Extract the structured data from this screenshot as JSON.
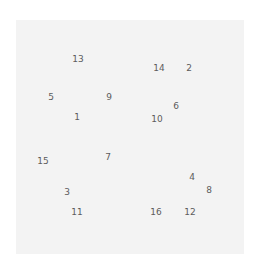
{
  "panel": {
    "background": "#f3f3f3"
  },
  "numbers": [
    {
      "label": "13",
      "x": 78,
      "y": 59
    },
    {
      "label": "14",
      "x": 159,
      "y": 68
    },
    {
      "label": "2",
      "x": 189,
      "y": 68
    },
    {
      "label": "5",
      "x": 51,
      "y": 97
    },
    {
      "label": "9",
      "x": 109,
      "y": 97
    },
    {
      "label": "6",
      "x": 176,
      "y": 106
    },
    {
      "label": "1",
      "x": 77,
      "y": 117
    },
    {
      "label": "10",
      "x": 157,
      "y": 119
    },
    {
      "label": "15",
      "x": 43,
      "y": 161
    },
    {
      "label": "7",
      "x": 108,
      "y": 157
    },
    {
      "label": "4",
      "x": 192,
      "y": 177
    },
    {
      "label": "8",
      "x": 209,
      "y": 190
    },
    {
      "label": "3",
      "x": 67,
      "y": 192
    },
    {
      "label": "11",
      "x": 77,
      "y": 212
    },
    {
      "label": "16",
      "x": 156,
      "y": 212
    },
    {
      "label": "12",
      "x": 190,
      "y": 212
    }
  ]
}
